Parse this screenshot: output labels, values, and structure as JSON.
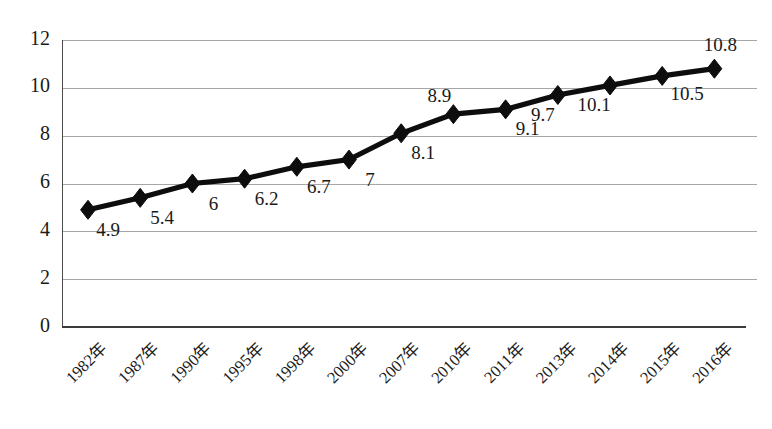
{
  "chart_data": {
    "type": "line",
    "title": "",
    "subtitle": "",
    "xlabel": "",
    "ylabel": "",
    "categories": [
      "1982年",
      "1987年",
      "1990年",
      "1995年",
      "1998年",
      "2000年",
      "2007年",
      "2010年",
      "2011年",
      "2013年",
      "2014年",
      "2015年",
      "2016年"
    ],
    "values": [
      4.9,
      5.4,
      6,
      6.2,
      6.7,
      7,
      8.1,
      8.9,
      9.1,
      9.7,
      10.1,
      10.5,
      10.8
    ],
    "data_labels": [
      "4.9",
      "5.4",
      "6",
      "6.2",
      "6.7",
      "7",
      "8.1",
      "8.9",
      "9.1",
      "9.7",
      "10.1",
      "10.5",
      "10.8"
    ],
    "ylim": [
      0,
      12
    ],
    "yticks": [
      0,
      2,
      4,
      6,
      8,
      10,
      12
    ],
    "ytick_labels": [
      "0",
      "2",
      "4",
      "6",
      "8",
      "10",
      "12"
    ],
    "grid": "horizontal",
    "legend": "none",
    "marker": "diamond",
    "series": [
      {
        "name": "",
        "color": "#0d0d0d",
        "values": [
          4.9,
          5.4,
          6,
          6.2,
          6.7,
          7,
          8.1,
          8.9,
          9.1,
          9.7,
          10.1,
          10.5,
          10.8
        ]
      }
    ],
    "label_offsets": [
      {
        "dx": 20,
        "dy": 26
      },
      {
        "dx": 22,
        "dy": 26
      },
      {
        "dx": 21,
        "dy": 26
      },
      {
        "dx": 22,
        "dy": 26
      },
      {
        "dx": 22,
        "dy": 26
      },
      {
        "dx": 21,
        "dy": 26
      },
      {
        "dx": 22,
        "dy": 26
      },
      {
        "dx": -14,
        "dy": -12
      },
      {
        "dx": 22,
        "dy": 26
      },
      {
        "dx": -15,
        "dy": 26
      },
      {
        "dx": -16,
        "dy": 26
      },
      {
        "dx": 25,
        "dy": 24
      },
      {
        "dx": 6,
        "dy": -18
      }
    ],
    "colors": {
      "line": "#0d0d0d",
      "marker": "#0d0d0d",
      "gridline": "#a6a6a6",
      "axis": "#4d4d4d",
      "text": "#1a1a1a",
      "background": "#ffffff"
    },
    "plot_area": {
      "left": 62,
      "top": 40,
      "right": 757,
      "bottom": 327
    }
  }
}
